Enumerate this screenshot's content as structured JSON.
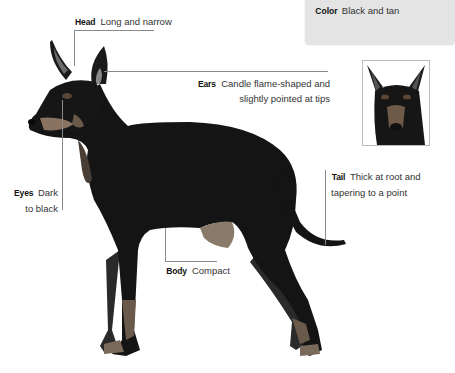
{
  "infobox": {
    "color_heading": "Color",
    "color_value": "Black and tan"
  },
  "annotations": [
    {
      "heading": "Head",
      "text": "Long and narrow"
    },
    {
      "heading": "Ears",
      "text_line1": "Candle flame-shaped and",
      "text_line2": "slightly pointed at tips"
    },
    {
      "heading": "Eyes",
      "text_line1": "Dark",
      "text_line2": "to black"
    },
    {
      "heading": "Tail",
      "text_line1": "Thick at root and",
      "text_line2": "tapering to a point"
    },
    {
      "heading": "Body",
      "text": "Compact"
    }
  ],
  "images": {
    "main": "black-and-tan-dog-side-profile",
    "thumbnail": "dog-head-closeup"
  },
  "colors": {
    "dog_black": "#141414",
    "tan": "#8a6e55",
    "leader_line": "#8a8a8a",
    "infobox_bg": "#e4e4e4"
  }
}
